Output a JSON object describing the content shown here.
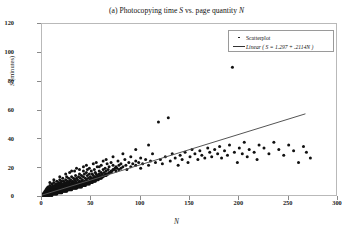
{
  "chart_data": {
    "type": "scatter",
    "title": "(a) Photocopying time S vs. page quantity N",
    "title_parts": {
      "pre": "(a) Photocopying time ",
      "sym1": "S",
      "mid": " vs. page quantity ",
      "sym2": "N"
    },
    "xlabel": "N",
    "ylabel": "S (minutes)",
    "ylabel_parts": {
      "sym": "S",
      "rest": " (minutes)"
    },
    "xlim": [
      0,
      300
    ],
    "ylim": [
      0,
      120
    ],
    "xticks": [
      0,
      50,
      100,
      150,
      200,
      250,
      300
    ],
    "yticks": [
      0,
      20,
      40,
      60,
      80,
      100,
      120
    ],
    "grid": false,
    "legend_position": "top-right",
    "legend": [
      {
        "key": "dot",
        "label": "Scatterplot"
      },
      {
        "key": "line",
        "label": "Linear ( S = 1.297 + .2114N )"
      }
    ],
    "fit": {
      "kind": "linear",
      "intercept": 1.297,
      "slope": 0.2114,
      "x_start": 0,
      "x_end": 267,
      "y_start": 1.3,
      "y_end": 57.7,
      "color": "#555555"
    },
    "marker": {
      "color": "#111111",
      "size": 1.5,
      "shape": "dot"
    },
    "points": [
      [
        1,
        1
      ],
      [
        1,
        2
      ],
      [
        2,
        1
      ],
      [
        2,
        2
      ],
      [
        2,
        3
      ],
      [
        3,
        1
      ],
      [
        3,
        2
      ],
      [
        3,
        3
      ],
      [
        3,
        4
      ],
      [
        4,
        1
      ],
      [
        4,
        2
      ],
      [
        4,
        3
      ],
      [
        4,
        4
      ],
      [
        4,
        5
      ],
      [
        5,
        1
      ],
      [
        5,
        2
      ],
      [
        5,
        3
      ],
      [
        5,
        4
      ],
      [
        5,
        5
      ],
      [
        5,
        6
      ],
      [
        6,
        1
      ],
      [
        6,
        2
      ],
      [
        6,
        3
      ],
      [
        6,
        4
      ],
      [
        6,
        5
      ],
      [
        6,
        7
      ],
      [
        7,
        1
      ],
      [
        7,
        2
      ],
      [
        7,
        3
      ],
      [
        7,
        4
      ],
      [
        7,
        5
      ],
      [
        7,
        6
      ],
      [
        8,
        1
      ],
      [
        8,
        2
      ],
      [
        8,
        3
      ],
      [
        8,
        4
      ],
      [
        8,
        5
      ],
      [
        8,
        6
      ],
      [
        8,
        8
      ],
      [
        9,
        2
      ],
      [
        9,
        3
      ],
      [
        9,
        4
      ],
      [
        9,
        5
      ],
      [
        9,
        6
      ],
      [
        9,
        7
      ],
      [
        10,
        1
      ],
      [
        10,
        2
      ],
      [
        10,
        3
      ],
      [
        10,
        4
      ],
      [
        10,
        5
      ],
      [
        10,
        6
      ],
      [
        10,
        7
      ],
      [
        10,
        9
      ],
      [
        11,
        2
      ],
      [
        11,
        3
      ],
      [
        11,
        4
      ],
      [
        11,
        5
      ],
      [
        11,
        6
      ],
      [
        11,
        8
      ],
      [
        12,
        2
      ],
      [
        12,
        3
      ],
      [
        12,
        4
      ],
      [
        12,
        5
      ],
      [
        12,
        6
      ],
      [
        12,
        7
      ],
      [
        12,
        10
      ],
      [
        13,
        2
      ],
      [
        13,
        3
      ],
      [
        13,
        4
      ],
      [
        13,
        5
      ],
      [
        13,
        6
      ],
      [
        13,
        8
      ],
      [
        14,
        2
      ],
      [
        14,
        3
      ],
      [
        14,
        4
      ],
      [
        14,
        5
      ],
      [
        14,
        6
      ],
      [
        14,
        7
      ],
      [
        14,
        9
      ],
      [
        15,
        2
      ],
      [
        15,
        3
      ],
      [
        15,
        4
      ],
      [
        15,
        5
      ],
      [
        15,
        6
      ],
      [
        15,
        7
      ],
      [
        15,
        8
      ],
      [
        15,
        11
      ],
      [
        16,
        3
      ],
      [
        16,
        4
      ],
      [
        16,
        5
      ],
      [
        16,
        6
      ],
      [
        16,
        7
      ],
      [
        16,
        9
      ],
      [
        17,
        3
      ],
      [
        17,
        4
      ],
      [
        17,
        5
      ],
      [
        17,
        6
      ],
      [
        17,
        8
      ],
      [
        17,
        10
      ],
      [
        18,
        3
      ],
      [
        18,
        4
      ],
      [
        18,
        5
      ],
      [
        18,
        6
      ],
      [
        18,
        7
      ],
      [
        18,
        9
      ],
      [
        18,
        12
      ],
      [
        19,
        3
      ],
      [
        19,
        4
      ],
      [
        19,
        5
      ],
      [
        19,
        6
      ],
      [
        19,
        8
      ],
      [
        19,
        10
      ],
      [
        20,
        3
      ],
      [
        20,
        4
      ],
      [
        20,
        5
      ],
      [
        20,
        6
      ],
      [
        20,
        7
      ],
      [
        20,
        9
      ],
      [
        20,
        11
      ],
      [
        21,
        4
      ],
      [
        21,
        5
      ],
      [
        21,
        6
      ],
      [
        21,
        7
      ],
      [
        21,
        8
      ],
      [
        21,
        13
      ],
      [
        22,
        4
      ],
      [
        22,
        5
      ],
      [
        22,
        6
      ],
      [
        22,
        7
      ],
      [
        22,
        9
      ],
      [
        22,
        11
      ],
      [
        23,
        4
      ],
      [
        23,
        5
      ],
      [
        23,
        6
      ],
      [
        23,
        7
      ],
      [
        23,
        8
      ],
      [
        23,
        10
      ],
      [
        24,
        4
      ],
      [
        24,
        5
      ],
      [
        24,
        6
      ],
      [
        24,
        7
      ],
      [
        24,
        9
      ],
      [
        24,
        12
      ],
      [
        25,
        4
      ],
      [
        25,
        5
      ],
      [
        25,
        6
      ],
      [
        25,
        7
      ],
      [
        25,
        8
      ],
      [
        25,
        10
      ],
      [
        25,
        14
      ],
      [
        26,
        5
      ],
      [
        26,
        6
      ],
      [
        26,
        7
      ],
      [
        26,
        8
      ],
      [
        26,
        9
      ],
      [
        26,
        11
      ],
      [
        27,
        5
      ],
      [
        27,
        6
      ],
      [
        27,
        7
      ],
      [
        27,
        8
      ],
      [
        27,
        10
      ],
      [
        27,
        13
      ],
      [
        28,
        5
      ],
      [
        28,
        6
      ],
      [
        28,
        7
      ],
      [
        28,
        8
      ],
      [
        28,
        9
      ],
      [
        28,
        11
      ],
      [
        29,
        5
      ],
      [
        29,
        6
      ],
      [
        29,
        7
      ],
      [
        29,
        9
      ],
      [
        29,
        12
      ],
      [
        30,
        5
      ],
      [
        30,
        6
      ],
      [
        30,
        7
      ],
      [
        30,
        8
      ],
      [
        30,
        10
      ],
      [
        30,
        14
      ],
      [
        31,
        6
      ],
      [
        31,
        7
      ],
      [
        31,
        8
      ],
      [
        31,
        9
      ],
      [
        31,
        11
      ],
      [
        32,
        6
      ],
      [
        32,
        7
      ],
      [
        32,
        8
      ],
      [
        32,
        10
      ],
      [
        32,
        13
      ],
      [
        33,
        6
      ],
      [
        33,
        7
      ],
      [
        33,
        8
      ],
      [
        33,
        9
      ],
      [
        33,
        12
      ],
      [
        34,
        6
      ],
      [
        34,
        7
      ],
      [
        34,
        9
      ],
      [
        34,
        11
      ],
      [
        34,
        15
      ],
      [
        35,
        6
      ],
      [
        35,
        7
      ],
      [
        35,
        8
      ],
      [
        35,
        10
      ],
      [
        35,
        13
      ],
      [
        36,
        7
      ],
      [
        36,
        8
      ],
      [
        36,
        9
      ],
      [
        36,
        12
      ],
      [
        37,
        7
      ],
      [
        37,
        8
      ],
      [
        37,
        10
      ],
      [
        37,
        14
      ],
      [
        38,
        7
      ],
      [
        38,
        8
      ],
      [
        38,
        9
      ],
      [
        38,
        11
      ],
      [
        38,
        16
      ],
      [
        39,
        7
      ],
      [
        39,
        9
      ],
      [
        39,
        10
      ],
      [
        39,
        13
      ],
      [
        40,
        7
      ],
      [
        40,
        8
      ],
      [
        40,
        9
      ],
      [
        40,
        11
      ],
      [
        40,
        15
      ],
      [
        41,
        8
      ],
      [
        41,
        9
      ],
      [
        41,
        12
      ],
      [
        42,
        8
      ],
      [
        42,
        10
      ],
      [
        42,
        14
      ],
      [
        42,
        18
      ],
      [
        43,
        8
      ],
      [
        43,
        9
      ],
      [
        43,
        11
      ],
      [
        43,
        16
      ],
      [
        44,
        8
      ],
      [
        44,
        10
      ],
      [
        44,
        13
      ],
      [
        45,
        9
      ],
      [
        45,
        10
      ],
      [
        45,
        12
      ],
      [
        45,
        17
      ],
      [
        46,
        9
      ],
      [
        46,
        11
      ],
      [
        46,
        15
      ],
      [
        47,
        9
      ],
      [
        47,
        10
      ],
      [
        47,
        13
      ],
      [
        48,
        9
      ],
      [
        48,
        11
      ],
      [
        48,
        16
      ],
      [
        48,
        20
      ],
      [
        49,
        10
      ],
      [
        49,
        12
      ],
      [
        49,
        14
      ],
      [
        50,
        10
      ],
      [
        50,
        11
      ],
      [
        50,
        13
      ],
      [
        50,
        18
      ],
      [
        51,
        10
      ],
      [
        51,
        12
      ],
      [
        51,
        16
      ],
      [
        52,
        11
      ],
      [
        52,
        13
      ],
      [
        52,
        15
      ],
      [
        53,
        11
      ],
      [
        53,
        12
      ],
      [
        53,
        19
      ],
      [
        54,
        11
      ],
      [
        54,
        14
      ],
      [
        54,
        17
      ],
      [
        55,
        12
      ],
      [
        55,
        13
      ],
      [
        55,
        16
      ],
      [
        56,
        12
      ],
      [
        56,
        15
      ],
      [
        56,
        21
      ],
      [
        57,
        12
      ],
      [
        57,
        14
      ],
      [
        58,
        13
      ],
      [
        58,
        16
      ],
      [
        58,
        18
      ],
      [
        59,
        13
      ],
      [
        59,
        15
      ],
      [
        60,
        13
      ],
      [
        60,
        14
      ],
      [
        60,
        17
      ],
      [
        60,
        22
      ],
      [
        61,
        14
      ],
      [
        61,
        16
      ],
      [
        62,
        14
      ],
      [
        62,
        19
      ],
      [
        63,
        15
      ],
      [
        63,
        17
      ],
      [
        64,
        15
      ],
      [
        64,
        20
      ],
      [
        65,
        15
      ],
      [
        65,
        16
      ],
      [
        65,
        18
      ],
      [
        66,
        16
      ],
      [
        66,
        23
      ],
      [
        67,
        16
      ],
      [
        67,
        19
      ],
      [
        68,
        17
      ],
      [
        68,
        21
      ],
      [
        69,
        17
      ],
      [
        70,
        17
      ],
      [
        70,
        18
      ],
      [
        70,
        24
      ],
      [
        71,
        18
      ],
      [
        72,
        19
      ],
      [
        72,
        22
      ],
      [
        73,
        19
      ],
      [
        74,
        20
      ],
      [
        75,
        18
      ],
      [
        75,
        21
      ],
      [
        76,
        20
      ],
      [
        77,
        25
      ],
      [
        78,
        19
      ],
      [
        78,
        22
      ],
      [
        80,
        20
      ],
      [
        80,
        23
      ],
      [
        82,
        21
      ],
      [
        84,
        26
      ],
      [
        85,
        22
      ],
      [
        86,
        19
      ],
      [
        88,
        24
      ],
      [
        90,
        21
      ],
      [
        90,
        28
      ],
      [
        92,
        23
      ],
      [
        95,
        22
      ],
      [
        95,
        25
      ],
      [
        98,
        24
      ],
      [
        100,
        20
      ],
      [
        100,
        27
      ],
      [
        102,
        23
      ],
      [
        105,
        26
      ],
      [
        108,
        22
      ],
      [
        110,
        25
      ],
      [
        112,
        30
      ],
      [
        115,
        24
      ],
      [
        118,
        52
      ],
      [
        120,
        26
      ],
      [
        122,
        23
      ],
      [
        125,
        28
      ],
      [
        128,
        55
      ],
      [
        130,
        25
      ],
      [
        132,
        30
      ],
      [
        135,
        27
      ],
      [
        138,
        22
      ],
      [
        140,
        29
      ],
      [
        142,
        26
      ],
      [
        145,
        31
      ],
      [
        148,
        24
      ],
      [
        150,
        28
      ],
      [
        152,
        33
      ],
      [
        155,
        30
      ],
      [
        158,
        26
      ],
      [
        160,
        32
      ],
      [
        162,
        29
      ],
      [
        165,
        27
      ],
      [
        168,
        34
      ],
      [
        170,
        31
      ],
      [
        172,
        28
      ],
      [
        175,
        33
      ],
      [
        178,
        30
      ],
      [
        180,
        35
      ],
      [
        182,
        27
      ],
      [
        185,
        32
      ],
      [
        188,
        29
      ],
      [
        190,
        36
      ],
      [
        193,
        90
      ],
      [
        195,
        31
      ],
      [
        198,
        24
      ],
      [
        200,
        34
      ],
      [
        203,
        30
      ],
      [
        205,
        38
      ],
      [
        208,
        28
      ],
      [
        210,
        33
      ],
      [
        215,
        31
      ],
      [
        218,
        26
      ],
      [
        220,
        36
      ],
      [
        225,
        34
      ],
      [
        230,
        30
      ],
      [
        235,
        38
      ],
      [
        240,
        33
      ],
      [
        245,
        29
      ],
      [
        250,
        36
      ],
      [
        255,
        32
      ],
      [
        260,
        24
      ],
      [
        265,
        35
      ],
      [
        268,
        31
      ],
      [
        272,
        27
      ],
      [
        30,
        18
      ],
      [
        35,
        20
      ],
      [
        45,
        22
      ],
      [
        55,
        24
      ],
      [
        65,
        26
      ],
      [
        72,
        28
      ],
      [
        82,
        30
      ],
      [
        95,
        33
      ],
      [
        108,
        36
      ],
      [
        62,
        25
      ],
      [
        52,
        23
      ],
      [
        42,
        21
      ],
      [
        38,
        19
      ],
      [
        8,
        10
      ],
      [
        12,
        12
      ],
      [
        18,
        14
      ],
      [
        24,
        16
      ],
      [
        28,
        17
      ],
      [
        33,
        18
      ],
      [
        46,
        19
      ],
      [
        58,
        21
      ]
    ]
  }
}
